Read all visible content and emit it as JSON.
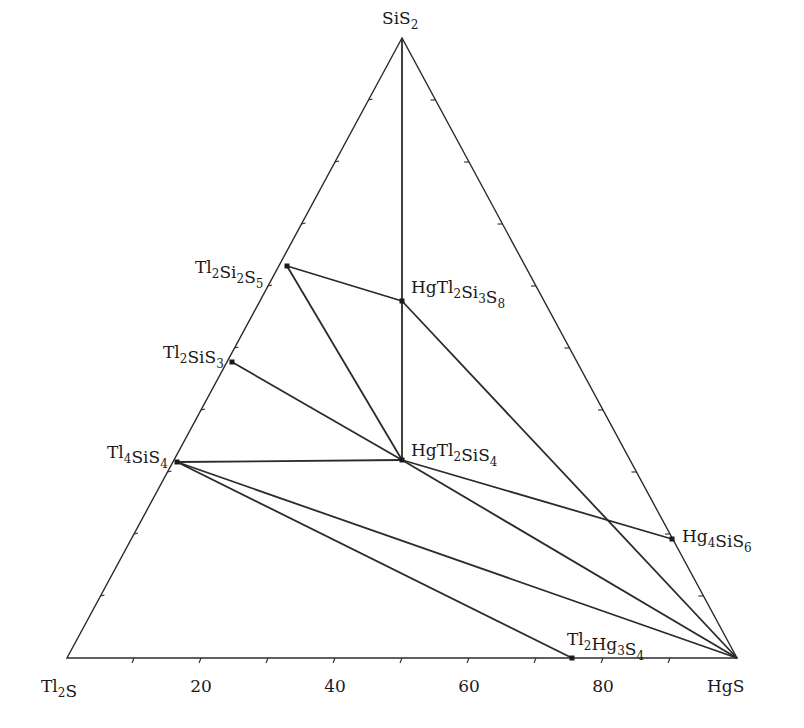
{
  "chart_data": {
    "type": "ternary-phase-diagram",
    "title": "",
    "system": "Tl2S–HgS–SiS2",
    "vertices": {
      "top": {
        "label": "SiS",
        "sub": "2",
        "x": 402,
        "y": 38
      },
      "left": {
        "label": "Tl",
        "sub": "2",
        "label2": "S",
        "x": 67,
        "y": 658
      },
      "right": {
        "label": "HgS",
        "x": 737,
        "y": 658
      }
    },
    "bottom_axis": {
      "ticks": [
        20,
        40,
        60,
        80
      ],
      "tick_spacing_pct": 10,
      "label_y": 692
    },
    "compounds": [
      {
        "id": "Tl2Si2S5",
        "parts": [
          [
            "Tl",
            "2"
          ],
          [
            "Si",
            "2"
          ],
          [
            "S",
            "5"
          ]
        ],
        "x": 287,
        "y": 266,
        "lx": 195,
        "ly": 273
      },
      {
        "id": "HgTl2Si3S8",
        "parts": [
          [
            "HgTl",
            "2"
          ],
          [
            "Si",
            "3"
          ],
          [
            "S",
            "8"
          ]
        ],
        "x": 402,
        "y": 301,
        "lx": 411,
        "ly": 293
      },
      {
        "id": "Tl2SiS3",
        "parts": [
          [
            "Tl",
            "2"
          ],
          [
            "SiS",
            "3"
          ]
        ],
        "x": 232,
        "y": 362,
        "lx": 163,
        "ly": 358
      },
      {
        "id": "Tl4SiS4",
        "parts": [
          [
            "Tl",
            "4"
          ],
          [
            "SiS",
            "4"
          ]
        ],
        "x": 177,
        "y": 462,
        "lx": 107,
        "ly": 458
      },
      {
        "id": "HgTl2SiS4",
        "parts": [
          [
            "HgTl",
            "2"
          ],
          [
            "SiS",
            "4"
          ]
        ],
        "x": 402,
        "y": 460,
        "lx": 411,
        "ly": 456
      },
      {
        "id": "Hg4SiS6",
        "parts": [
          [
            "Hg",
            "4"
          ],
          [
            "SiS",
            "6"
          ]
        ],
        "x": 672,
        "y": 539,
        "lx": 682,
        "ly": 542
      },
      {
        "id": "Tl2Hg3S4",
        "parts": [
          [
            "Tl",
            "2"
          ],
          [
            "Hg",
            "3"
          ],
          [
            "S",
            "4"
          ]
        ],
        "x": 572,
        "y": 658,
        "lx": 567,
        "ly": 645
      }
    ],
    "tie_lines": [
      [
        "SiS2",
        "HgTl2SiS4"
      ],
      [
        "Tl2Si2S5",
        "HgTl2Si3S8"
      ],
      [
        "Tl2Si2S5",
        "HgTl2SiS4"
      ],
      [
        "Tl2SiS3",
        "HgTl2SiS4"
      ],
      [
        "Tl4SiS4",
        "HgTl2SiS4"
      ],
      [
        "Tl4SiS4",
        "HgS"
      ],
      [
        "Tl4SiS4",
        "Tl2Hg3S4"
      ],
      [
        "HgTl2Si3S8",
        "HgS"
      ],
      [
        "HgTl2SiS4",
        "Hg4SiS6"
      ],
      [
        "HgTl2SiS4",
        "HgS"
      ]
    ]
  }
}
